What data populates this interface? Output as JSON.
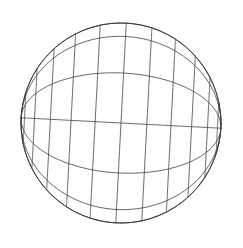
{
  "figure": {
    "title": "Wireframe Sphere Graticule",
    "type": "line-drawing",
    "canvas_width": 243,
    "canvas_height": 248,
    "background_color": "#ffffff"
  },
  "chart_data": {
    "type": "line",
    "title": "Wireframe Sphere Graticule",
    "subtitle": "",
    "xlabel": "",
    "ylabel": "",
    "grid": true,
    "legend_position": "none",
    "annotations": [],
    "tick_labels": [],
    "projection": "orthographic",
    "sphere": {
      "center_x": 121,
      "center_y": 123,
      "radius": 100
    },
    "orientation": {
      "axis_tilt_deg": 52,
      "axis_roll_deg": -41,
      "north_pole_x": 175,
      "north_pole_y": 78,
      "south_pole_x": 68,
      "south_pole_y": 172,
      "both_poles_visible": true
    },
    "series": [
      {
        "name": "outline",
        "kind": "silhouette",
        "count": 1
      },
      {
        "name": "meridians",
        "kind": "longitude",
        "count": 12,
        "spacing_deg": 30,
        "values": [
          0,
          30,
          60,
          90,
          120,
          150,
          180,
          210,
          240,
          270,
          300,
          330
        ]
      },
      {
        "name": "parallels",
        "kind": "latitude",
        "count": 11,
        "spacing_deg": 15,
        "values": [
          -75,
          -60,
          -45,
          -30,
          -15,
          0,
          15,
          30,
          45,
          60,
          75
        ]
      }
    ]
  },
  "style": {
    "stroke_color": "#4a4a52",
    "outline_color": "#3a3a42",
    "stroke_width": 0.85,
    "outline_width": 1.0,
    "fill": "none"
  }
}
